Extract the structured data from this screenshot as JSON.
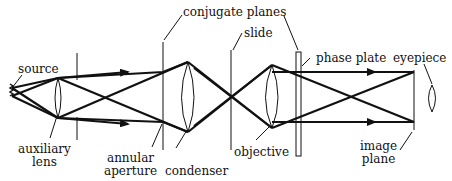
{
  "diagram": {
    "labels": {
      "source": "source",
      "auxiliary_lens": [
        "auxiliary",
        "lens"
      ],
      "annular_aperture": [
        "annular",
        "aperture"
      ],
      "condenser": "condenser",
      "conjugate_planes": "conjugate planes",
      "slide": "slide",
      "objective": "objective",
      "phase_plate": "phase plate",
      "eyepiece": "eyepiece",
      "image_plane": [
        "image",
        "plane"
      ]
    },
    "colors": {
      "line": "#111111",
      "background": "#ffffff"
    }
  }
}
